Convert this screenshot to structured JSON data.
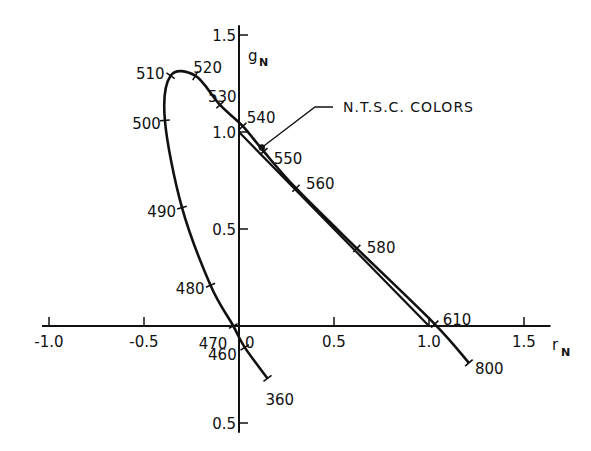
{
  "chart_data": {
    "type": "line",
    "title": "",
    "xlabel": "r",
    "xlabel_sub": "N",
    "ylabel": "g",
    "ylabel_sub": "N",
    "xlim": [
      -1.1,
      1.65
    ],
    "ylim": [
      -0.55,
      1.6
    ],
    "grid": false,
    "x_ticks": [
      {
        "value": -1.0,
        "label": "-1.0"
      },
      {
        "value": -0.5,
        "label": "-0.5"
      },
      {
        "value": 0.5,
        "label": "0.5"
      },
      {
        "value": 1.0,
        "label": "1.0"
      },
      {
        "value": 1.5,
        "label": "1.5"
      }
    ],
    "y_ticks": [
      {
        "value": 1.5,
        "label": "1.5"
      },
      {
        "value": 1.0,
        "label": "1.0"
      },
      {
        "value": 0.5,
        "label": "0.5"
      },
      {
        "value": -0.5,
        "label": "0.5"
      }
    ],
    "origin_label": "0",
    "series": [
      {
        "name": "spectrum locus",
        "points": [
          {
            "wavelength": 360,
            "r": 0.15,
            "g": -0.27
          },
          {
            "wavelength": 460,
            "r": 0.03,
            "g": -0.11
          },
          {
            "wavelength": 470,
            "r": -0.03,
            "g": 0.0
          },
          {
            "wavelength": 480,
            "r": -0.15,
            "g": 0.21
          },
          {
            "wavelength": 490,
            "r": -0.3,
            "g": 0.61
          },
          {
            "wavelength": 500,
            "r": -0.39,
            "g": 1.06
          },
          {
            "wavelength": 510,
            "r": -0.36,
            "g": 1.29
          },
          {
            "wavelength": 520,
            "r": -0.23,
            "g": 1.29
          },
          {
            "wavelength": 530,
            "r": -0.1,
            "g": 1.14
          },
          {
            "wavelength": 540,
            "r": 0.02,
            "g": 1.03
          },
          {
            "wavelength": 550,
            "r": 0.13,
            "g": 0.9
          },
          {
            "wavelength": 560,
            "r": 0.3,
            "g": 0.71
          },
          {
            "wavelength": 580,
            "r": 0.62,
            "g": 0.4
          },
          {
            "wavelength": 610,
            "r": 1.03,
            "g": 0.01
          },
          {
            "wavelength": 800,
            "r": 1.21,
            "g": -0.19
          }
        ]
      },
      {
        "name": "N.T.S.C. COLORS",
        "points": [
          {
            "r": 0.0,
            "g": 1.0
          },
          {
            "r": 1.0,
            "g": 0.0
          }
        ]
      }
    ],
    "annotations": [
      {
        "text": "N.T.S.C. COLORS",
        "points_to": {
          "r": 0.12,
          "g": 0.92
        }
      }
    ]
  }
}
